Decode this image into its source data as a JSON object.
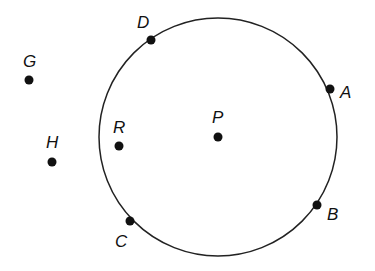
{
  "diagram": {
    "circle": {
      "cx": 218,
      "cy": 137,
      "r": 119,
      "stroke": "#222"
    },
    "points": [
      {
        "id": "D",
        "label": "D",
        "x": 151,
        "y": 40,
        "lx": 137,
        "ly": 28
      },
      {
        "id": "A",
        "label": "A",
        "x": 330,
        "y": 89,
        "lx": 340,
        "ly": 98
      },
      {
        "id": "B",
        "label": "B",
        "x": 317,
        "y": 205,
        "lx": 327,
        "ly": 220
      },
      {
        "id": "C",
        "label": "C",
        "x": 130,
        "y": 221,
        "lx": 115,
        "ly": 247
      },
      {
        "id": "R",
        "label": "R",
        "x": 119,
        "y": 146,
        "lx": 113,
        "ly": 133
      },
      {
        "id": "P",
        "label": "P",
        "x": 218,
        "y": 137,
        "lx": 212,
        "ly": 123
      },
      {
        "id": "H",
        "label": "H",
        "x": 52,
        "y": 162,
        "lx": 46,
        "ly": 148
      },
      {
        "id": "G",
        "label": "G",
        "x": 29,
        "y": 80,
        "lx": 23,
        "ly": 67
      }
    ]
  }
}
